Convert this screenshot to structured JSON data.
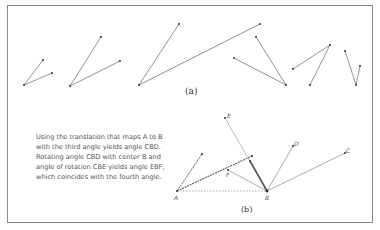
{
  "figure": {
    "part_a": {
      "caption": "(a)",
      "angles": [
        {
          "vertex": [
            24,
            85
          ],
          "ends": [
            [
              43,
              60
            ],
            [
              52,
              73
            ]
          ]
        },
        {
          "vertex": [
            70,
            86
          ],
          "ends": [
            [
              101,
              37
            ],
            [
              120,
              61
            ]
          ]
        },
        {
          "vertex": [
            139,
            85
          ],
          "ends": [
            [
              179,
              24
            ],
            [
              260,
              24
            ]
          ]
        },
        {
          "vertex": [
            286,
            85
          ],
          "ends": [
            [
              256,
              37
            ],
            [
              234,
              58
            ]
          ]
        },
        {
          "vertex": [
            330,
            45
          ],
          "ends": [
            [
              293,
              69
            ],
            [
              310,
              85
            ]
          ]
        },
        {
          "vertex": [
            356,
            85
          ],
          "ends": [
            [
              345,
              51
            ],
            [
              360,
              66
            ]
          ]
        }
      ]
    },
    "part_b": {
      "caption": "(b)",
      "description_lines": [
        "Using the translation that maps A to B",
        "with the third angle yields angle CBD.",
        "Rotating angle CBD with center B and",
        "angle of rotation CBE yields angle EBF,",
        "which coincides with the fourth angle."
      ],
      "points": {
        "A": {
          "label": "A",
          "xy": [
            177,
            191
          ]
        },
        "B": {
          "label": "B",
          "xy": [
            267,
            191
          ]
        },
        "C": {
          "label": "C",
          "xy": [
            345,
            153
          ]
        },
        "D": {
          "label": "D",
          "xy": [
            293,
            146
          ]
        },
        "E": {
          "label": "E",
          "xy": [
            225,
            118
          ]
        },
        "F": {
          "label": "F",
          "xy": [
            228,
            170
          ]
        }
      }
    }
  }
}
